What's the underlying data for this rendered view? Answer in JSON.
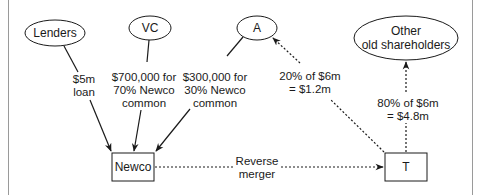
{
  "nodes": {
    "lenders": {
      "label": "Lenders",
      "shape": "ellipse"
    },
    "vc": {
      "label": "VC",
      "shape": "ellipse"
    },
    "a": {
      "label": "A",
      "shape": "ellipse"
    },
    "other": {
      "line1": "Other",
      "line2": "old shareholders",
      "shape": "ellipse"
    },
    "newco": {
      "label": "Newco",
      "shape": "rectangle"
    },
    "t": {
      "label": "T",
      "shape": "rectangle"
    }
  },
  "edges": {
    "lenders_to_newco": {
      "line1": "$5m",
      "line2": "loan",
      "style": "solid"
    },
    "vc_to_newco": {
      "line1": "$700,000 for",
      "line2": "70% Newco",
      "line3": "common",
      "style": "solid"
    },
    "a_to_newco": {
      "line1": "$300,000 for",
      "line2": "30% Newco",
      "line3": "common",
      "style": "solid"
    },
    "t_to_a": {
      "line1": "20% of $6m",
      "line2": "= $1.2m",
      "style": "dotted"
    },
    "t_to_other": {
      "line1": "80% of $6m",
      "line2": "= $4.8m",
      "style": "dotted"
    },
    "newco_to_t": {
      "line1": "Reverse",
      "line2": "merger",
      "style": "dotted"
    }
  },
  "colors": {
    "stroke": "#1a1a1a",
    "frame": "#9a9a9a",
    "background": "#ffffff"
  }
}
